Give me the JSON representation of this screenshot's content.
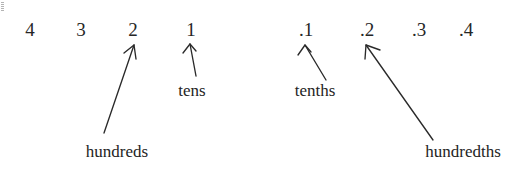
{
  "diagram": {
    "background_color": "#ffffff",
    "ink_color": "#262626",
    "whole_number_digits": [
      {
        "text": "4",
        "x": 30,
        "y": 20,
        "place": "thousands"
      },
      {
        "text": "3",
        "x": 81,
        "y": 20,
        "place": "hundreds"
      },
      {
        "text": "2",
        "x": 133,
        "y": 20,
        "place": "tens"
      },
      {
        "text": "1",
        "x": 191,
        "y": 20,
        "place": "ones"
      }
    ],
    "decimal_digits": [
      {
        "text": ".1",
        "x": 306,
        "y": 20,
        "place": "tenths"
      },
      {
        "text": ".2",
        "x": 367,
        "y": 20,
        "place": "hundredths"
      },
      {
        "text": ".3",
        "x": 419,
        "y": 20,
        "place": "thousandths"
      },
      {
        "text": ".4",
        "x": 466,
        "y": 20,
        "place": "ten-thousandths"
      }
    ],
    "labels": [
      {
        "text": "tens",
        "x": 192,
        "y": 82,
        "points_to": "1"
      },
      {
        "text": "hundreds",
        "x": 117,
        "y": 143,
        "points_to": "2"
      },
      {
        "text": "tenths",
        "x": 315,
        "y": 82,
        "points_to": ".1"
      },
      {
        "text": "hundredths",
        "x": 463,
        "y": 143,
        "points_to": ".2"
      }
    ],
    "arrows": [
      {
        "name": "tens-arrow",
        "from_x": 196,
        "from_y": 76,
        "to_x": 190,
        "to_y": 44,
        "head_left_x": 183,
        "head_left_y": 53,
        "head_right_x": 196,
        "head_right_y": 51
      },
      {
        "name": "hundreds-arrow",
        "from_x": 104,
        "from_y": 133,
        "to_x": 134,
        "to_y": 45,
        "head_left_x": 124,
        "head_left_y": 53,
        "head_right_x": 136,
        "head_right_y": 59
      },
      {
        "name": "tenths-arrow",
        "from_x": 326,
        "from_y": 80,
        "to_x": 305,
        "to_y": 45,
        "head_left_x": 298,
        "head_left_y": 55,
        "head_right_x": 311,
        "head_right_y": 52
      },
      {
        "name": "hundredths-arrow",
        "from_x": 433,
        "from_y": 140,
        "to_x": 366,
        "to_y": 45,
        "head_left_x": 365,
        "head_left_y": 59,
        "head_right_x": 380,
        "head_right_y": 50
      }
    ]
  }
}
